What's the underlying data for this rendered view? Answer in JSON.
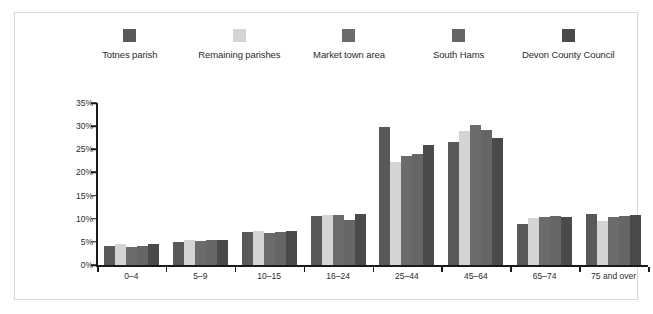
{
  "chart_data": {
    "type": "bar",
    "title": "",
    "xlabel": "",
    "ylabel": "",
    "ylim": [
      0,
      35
    ],
    "grid": false,
    "legend_position": "top",
    "ytick_labels": [
      "0%",
      "5%",
      "10%",
      "15%",
      "20%",
      "25%",
      "30%",
      "35%"
    ],
    "ytick_values": [
      0,
      5,
      10,
      15,
      20,
      25,
      30,
      35
    ],
    "categories": [
      "0–4",
      "5–9",
      "10–15",
      "16–24",
      "25–44",
      "45–64",
      "65–74",
      "75 and over"
    ],
    "series": [
      {
        "name": "Totnes parish",
        "color": "#595959",
        "values": [
          4.2,
          5.0,
          7.1,
          10.6,
          29.8,
          26.6,
          8.8,
          11.0
        ]
      },
      {
        "name": "Remaining parishes",
        "color": "#d4d4d4",
        "values": [
          4.6,
          5.3,
          7.3,
          10.9,
          22.2,
          29.0,
          10.2,
          9.5
        ]
      },
      {
        "name": "Market town area",
        "color": "#6b6b6b",
        "values": [
          4.0,
          5.2,
          6.9,
          10.9,
          23.6,
          30.3,
          10.4,
          10.3
        ]
      },
      {
        "name": "South Hams",
        "color": "#666666",
        "values": [
          4.1,
          5.3,
          7.2,
          9.8,
          23.9,
          29.2,
          10.5,
          10.6
        ]
      },
      {
        "name": "Devon County Council",
        "color": "#4a4a4a",
        "values": [
          4.5,
          5.3,
          7.3,
          11.0,
          25.9,
          27.4,
          10.3,
          10.7
        ]
      }
    ]
  }
}
